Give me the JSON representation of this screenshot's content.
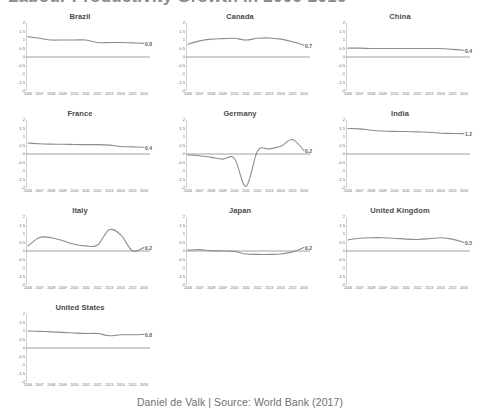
{
  "page": {
    "title_partial": "Labour Productivity Growth in 2006-2016",
    "footer": "Daniel de Valk | Source: World Bank (2017)"
  },
  "axis": {
    "y_ticks": [
      "2",
      "1.5",
      "1",
      "0.5",
      "0",
      "-0.5",
      "-1",
      "-1.5",
      "-2"
    ],
    "y_values": [
      2,
      1.5,
      1,
      0.5,
      0,
      -0.5,
      -1,
      -1.5,
      -2
    ],
    "ylim": [
      -2,
      2
    ],
    "x_ticks": [
      "2006",
      "2007",
      "2008",
      "2009",
      "2010",
      "2011",
      "2012",
      "2013",
      "2014",
      "2015",
      "2016"
    ]
  },
  "chart_data": {
    "type": "line",
    "title": "Labour Productivity Growth in 2006-2016",
    "xlabel": "",
    "ylabel": "",
    "ylim": [
      -2,
      2
    ],
    "grid": false,
    "legend": "none",
    "x": [
      2006,
      2007,
      2008,
      2009,
      2010,
      2011,
      2012,
      2013,
      2014,
      2015,
      2016
    ],
    "series": [
      {
        "name": "Brazil",
        "values": [
          1.2,
          1.1,
          1.0,
          1.0,
          1.0,
          1.0,
          0.85,
          0.85,
          0.85,
          0.83,
          0.8
        ],
        "end_label": "0.8"
      },
      {
        "name": "Canada",
        "values": [
          0.75,
          0.95,
          1.05,
          1.08,
          1.1,
          1.0,
          1.1,
          1.12,
          1.05,
          0.9,
          0.7
        ],
        "end_label": "0.7"
      },
      {
        "name": "China",
        "values": [
          0.52,
          0.52,
          0.5,
          0.5,
          0.5,
          0.5,
          0.5,
          0.5,
          0.5,
          0.45,
          0.4
        ],
        "end_label": "0.4"
      },
      {
        "name": "France",
        "values": [
          0.65,
          0.6,
          0.58,
          0.57,
          0.56,
          0.55,
          0.55,
          0.52,
          0.44,
          0.42,
          0.4
        ],
        "end_label": "0.4"
      },
      {
        "name": "Germany",
        "values": [
          -0.05,
          -0.1,
          -0.2,
          -0.3,
          -0.25,
          -1.9,
          0.18,
          0.3,
          0.45,
          0.85,
          0.2
        ],
        "end_label": "0.2"
      },
      {
        "name": "India",
        "values": [
          1.5,
          1.48,
          1.4,
          1.35,
          1.33,
          1.32,
          1.3,
          1.28,
          1.22,
          1.21,
          1.2
        ],
        "end_label": "1.2"
      },
      {
        "name": "Italy",
        "values": [
          0.3,
          0.8,
          0.78,
          0.6,
          0.4,
          0.3,
          0.35,
          1.25,
          0.95,
          0.02,
          0.2
        ],
        "end_label": "0.2"
      },
      {
        "name": "Japan",
        "values": [
          0.05,
          0.08,
          0.02,
          0.0,
          -0.02,
          -0.18,
          -0.2,
          -0.2,
          -0.18,
          -0.05,
          0.2
        ],
        "end_label": "0.2"
      },
      {
        "name": "United Kingdom",
        "values": [
          0.65,
          0.75,
          0.78,
          0.78,
          0.75,
          0.7,
          0.68,
          0.72,
          0.78,
          0.7,
          0.5
        ],
        "end_label": "0.5"
      },
      {
        "name": "United States",
        "values": [
          1.0,
          0.98,
          0.95,
          0.92,
          0.88,
          0.85,
          0.85,
          0.72,
          0.78,
          0.78,
          0.8
        ],
        "end_label": "0.8"
      }
    ]
  },
  "colors": {
    "line": "#8c8c8c",
    "zero_axis": "#7a7a7a",
    "text": "#6b6b6b",
    "title": "#4a4a4a"
  }
}
